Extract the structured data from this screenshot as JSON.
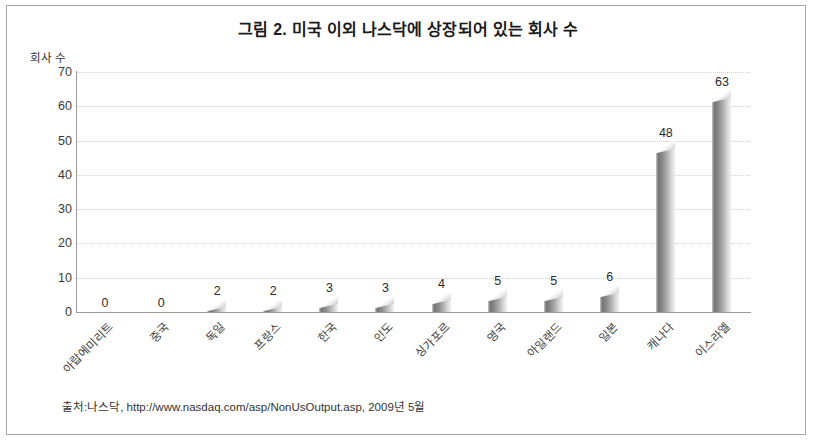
{
  "figure": {
    "title": "그림 2. 미국 이외 나스닥에 상장되어 있는 회사 수",
    "source_note": "출처:나스닥, http://www.nasdaq.com/asp/NonUsOutput.asp, 2009년 5월",
    "border_color": "#a8a8a8",
    "background": "#ffffff"
  },
  "chart_data": {
    "type": "bar",
    "title": "그림 2. 미국 이외 나스닥에 상장되어 있는 회사 수",
    "xlabel": "",
    "ylabel": "회사 수",
    "categories": [
      "아랍에미리트",
      "중국",
      "독일",
      "프랑스",
      "한국",
      "인도",
      "싱가포르",
      "영국",
      "아일랜드",
      "일본",
      "캐나다",
      "이스라엘"
    ],
    "values": [
      0,
      0,
      2,
      2,
      3,
      3,
      4,
      5,
      5,
      6,
      48,
      63
    ],
    "value_labels": [
      "0",
      "0",
      "2",
      "2",
      "3",
      "3",
      "4",
      "5",
      "5",
      "6",
      "48",
      "63"
    ],
    "ylim": [
      0,
      70
    ],
    "yticks": [
      0,
      10,
      20,
      30,
      40,
      50,
      60,
      70
    ],
    "ytick_labels": [
      "0",
      "10",
      "20",
      "30",
      "40",
      "50",
      "60",
      "70"
    ],
    "grid": true,
    "grid_style": "dotted",
    "grid_color": "#cfcfcf",
    "legend": null,
    "bar_style": "3d-cylinder",
    "bar_color": "#8f8f8f"
  }
}
